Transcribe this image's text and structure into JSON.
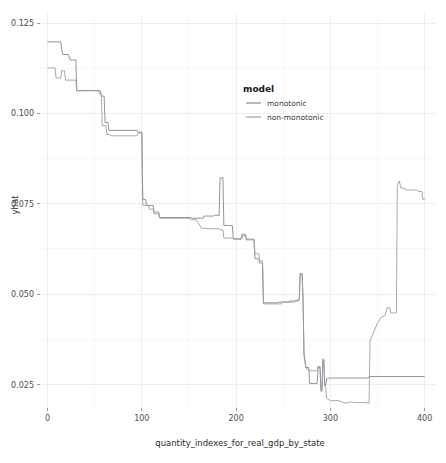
{
  "figure": {
    "width": 446,
    "height": 463,
    "background": "#ffffff"
  },
  "axes": {
    "x_title": "quantity_indexes_for_real_gdp_by_state",
    "y_title": "yhat",
    "x_ticks": [
      "0",
      "100",
      "200",
      "300",
      "400"
    ],
    "y_ticks": [
      "0.025",
      "0.050",
      "0.075",
      "0.100",
      "0.125"
    ]
  },
  "legend": {
    "title": "model",
    "entries": [
      {
        "label": "monotonic",
        "color": "#7f7f8c"
      },
      {
        "label": "non-monotonic",
        "color": "#9a9aa4"
      }
    ]
  },
  "chart_data": {
    "type": "line",
    "title": "",
    "subtitle": "",
    "xlabel": "quantity_indexes_for_real_gdp_by_state",
    "ylabel": "yhat",
    "xlim": [
      -8,
      412
    ],
    "ylim": [
      0.0185,
      0.1275
    ],
    "xticks": [
      0,
      100,
      200,
      300,
      400
    ],
    "yticks": [
      0.025,
      0.05,
      0.075,
      0.1,
      0.125
    ],
    "xminor": [
      50,
      150,
      250,
      350
    ],
    "yminor": [
      0.0375,
      0.0625,
      0.0875,
      0.1125
    ],
    "grid": true,
    "legend_position": "inside-top-right",
    "legend_title": "model",
    "series": [
      {
        "name": "monotonic",
        "color": "#7f7f8c",
        "points": [
          [
            0,
            0.1198
          ],
          [
            14,
            0.1198
          ],
          [
            16,
            0.1163
          ],
          [
            22,
            0.1163
          ],
          [
            24,
            0.1148
          ],
          [
            30,
            0.1148
          ],
          [
            31,
            0.1063
          ],
          [
            56,
            0.1063
          ],
          [
            57,
            0.1048
          ],
          [
            60,
            0.1048
          ],
          [
            61,
            0.0975
          ],
          [
            64,
            0.0975
          ],
          [
            65,
            0.0953
          ],
          [
            95,
            0.0953
          ],
          [
            96,
            0.0948
          ],
          [
            99,
            0.0948
          ],
          [
            100,
            0.0948
          ],
          [
            101,
            0.0762
          ],
          [
            104,
            0.0762
          ],
          [
            105,
            0.0745
          ],
          [
            112,
            0.0745
          ],
          [
            113,
            0.0727
          ],
          [
            118,
            0.0727
          ],
          [
            119,
            0.0712
          ],
          [
            152,
            0.0712
          ],
          [
            153,
            0.071
          ],
          [
            165,
            0.071
          ],
          [
            166,
            0.0716
          ],
          [
            176,
            0.0716
          ],
          [
            177,
            0.0718
          ],
          [
            182,
            0.0718
          ],
          [
            183,
            0.0822
          ],
          [
            186,
            0.0822
          ],
          [
            187,
            0.069
          ],
          [
            196,
            0.069
          ],
          [
            197,
            0.0653
          ],
          [
            206,
            0.0653
          ],
          [
            207,
            0.0662
          ],
          [
            210,
            0.0662
          ],
          [
            211,
            0.0652
          ],
          [
            219,
            0.0652
          ],
          [
            220,
            0.0598
          ],
          [
            224,
            0.0598
          ],
          [
            225,
            0.0586
          ],
          [
            228,
            0.0586
          ],
          [
            229,
            0.0476
          ],
          [
            244,
            0.0476
          ],
          [
            245,
            0.0478
          ],
          [
            256,
            0.0478
          ],
          [
            257,
            0.0481
          ],
          [
            266,
            0.0481
          ],
          [
            267,
            0.0486
          ],
          [
            268,
            0.0557
          ],
          [
            270,
            0.0557
          ],
          [
            271,
            0.0486
          ],
          [
            272,
            0.033
          ],
          [
            274,
            0.0297
          ],
          [
            277,
            0.0297
          ],
          [
            278,
            0.0253
          ],
          [
            286,
            0.0253
          ],
          [
            287,
            0.0298
          ],
          [
            289,
            0.0298
          ],
          [
            290,
            0.0234
          ],
          [
            291,
            0.0234
          ],
          [
            292,
            0.0318
          ],
          [
            293,
            0.0318
          ],
          [
            294,
            0.0247
          ],
          [
            295,
            0.0247
          ],
          [
            296,
            0.0266
          ],
          [
            300,
            0.0268
          ],
          [
            340,
            0.0268
          ],
          [
            341,
            0.0272
          ],
          [
            400,
            0.0272
          ]
        ]
      },
      {
        "name": "non-monotonic",
        "color": "#9a9aa4",
        "points": [
          [
            0,
            0.1126
          ],
          [
            8,
            0.1126
          ],
          [
            9,
            0.1098
          ],
          [
            14,
            0.1098
          ],
          [
            15,
            0.1118
          ],
          [
            18,
            0.1118
          ],
          [
            19,
            0.1092
          ],
          [
            30,
            0.1092
          ],
          [
            31,
            0.1063
          ],
          [
            54,
            0.1063
          ],
          [
            55,
            0.1055
          ],
          [
            57,
            0.1055
          ],
          [
            58,
            0.0966
          ],
          [
            62,
            0.0966
          ],
          [
            63,
            0.0942
          ],
          [
            66,
            0.0942
          ],
          [
            67,
            0.0938
          ],
          [
            95,
            0.0938
          ],
          [
            96,
            0.0946
          ],
          [
            100,
            0.0946
          ],
          [
            101,
            0.0746
          ],
          [
            107,
            0.0746
          ],
          [
            108,
            0.0735
          ],
          [
            112,
            0.0735
          ],
          [
            113,
            0.0722
          ],
          [
            118,
            0.0722
          ],
          [
            119,
            0.071
          ],
          [
            150,
            0.071
          ],
          [
            151,
            0.0708
          ],
          [
            158,
            0.0705
          ],
          [
            163,
            0.0683
          ],
          [
            170,
            0.0681
          ],
          [
            182,
            0.0681
          ],
          [
            183,
            0.0678
          ],
          [
            186,
            0.0678
          ],
          [
            187,
            0.0655
          ],
          [
            196,
            0.0655
          ],
          [
            197,
            0.0652
          ],
          [
            205,
            0.0652
          ],
          [
            206,
            0.0666
          ],
          [
            210,
            0.0666
          ],
          [
            211,
            0.065
          ],
          [
            219,
            0.065
          ],
          [
            220,
            0.0612
          ],
          [
            224,
            0.0612
          ],
          [
            225,
            0.0592
          ],
          [
            228,
            0.0592
          ],
          [
            229,
            0.0473
          ],
          [
            248,
            0.0473
          ],
          [
            249,
            0.0478
          ],
          [
            262,
            0.0478
          ],
          [
            263,
            0.0482
          ],
          [
            267,
            0.0486
          ],
          [
            268,
            0.0557
          ],
          [
            270,
            0.0557
          ],
          [
            271,
            0.048
          ],
          [
            272,
            0.034
          ],
          [
            274,
            0.0295
          ],
          [
            278,
            0.0288
          ],
          [
            286,
            0.0288
          ],
          [
            287,
            0.03
          ],
          [
            289,
            0.03
          ],
          [
            290,
            0.0231
          ],
          [
            291,
            0.0231
          ],
          [
            292,
            0.032
          ],
          [
            293,
            0.032
          ],
          [
            294,
            0.0244
          ],
          [
            295,
            0.0244
          ],
          [
            296,
            0.0212
          ],
          [
            300,
            0.0205
          ],
          [
            308,
            0.0206
          ],
          [
            314,
            0.02
          ],
          [
            318,
            0.0199
          ],
          [
            322,
            0.0202
          ],
          [
            326,
            0.02
          ],
          [
            338,
            0.02
          ],
          [
            339,
            0.0199
          ],
          [
            341,
            0.0199
          ],
          [
            342,
            0.037
          ],
          [
            346,
            0.0396
          ],
          [
            350,
            0.042
          ],
          [
            354,
            0.0436
          ],
          [
            358,
            0.0441
          ],
          [
            360,
            0.0462
          ],
          [
            363,
            0.0462
          ],
          [
            364,
            0.0448
          ],
          [
            370,
            0.0448
          ],
          [
            371,
            0.08
          ],
          [
            373,
            0.0813
          ],
          [
            375,
            0.0793
          ],
          [
            379,
            0.0793
          ],
          [
            380,
            0.0788
          ],
          [
            392,
            0.0788
          ],
          [
            393,
            0.0784
          ],
          [
            397,
            0.0784
          ],
          [
            398,
            0.0762
          ],
          [
            400,
            0.0762
          ]
        ]
      }
    ]
  }
}
